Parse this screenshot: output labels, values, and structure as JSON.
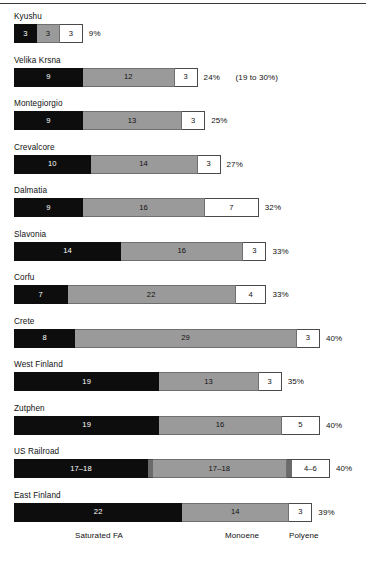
{
  "chart_data": {
    "type": "bar",
    "subtype": "stacked-horizontal",
    "title": "",
    "xlabel": "",
    "ylabel": "",
    "grid": false,
    "legend_position": "bottom",
    "series": [
      {
        "name": "Saturated FA",
        "color": "#0d0d0d"
      },
      {
        "name": "Monoene",
        "color": "#9a9a9a"
      },
      {
        "name": "Polyene",
        "color": "#ffffff"
      }
    ],
    "categories": [
      "Kyushu",
      "Velika Krsna",
      "Montegiorgio",
      "Crevalcore",
      "Dalmatia",
      "Slavonia",
      "Corfu",
      "Crete",
      "West Finland",
      "Zutphen",
      "US Railroad",
      "East Finland"
    ],
    "rows": [
      {
        "label": "Kyushu",
        "segments": [
          {
            "series": "Saturated FA",
            "label": "3",
            "value": 3
          },
          {
            "series": "Monoene",
            "label": "3",
            "value": 3
          },
          {
            "series": "Polyene",
            "label": "3",
            "value": 3
          }
        ],
        "total_label": "9%",
        "total": 9,
        "note": ""
      },
      {
        "label": "Velika Krsna",
        "segments": [
          {
            "series": "Saturated FA",
            "label": "9",
            "value": 9
          },
          {
            "series": "Monoene",
            "label": "12",
            "value": 12
          },
          {
            "series": "Polyene",
            "label": "3",
            "value": 3
          }
        ],
        "total_label": "24%",
        "total": 24,
        "note": "(19 to 30%)"
      },
      {
        "label": "Montegiorgio",
        "segments": [
          {
            "series": "Saturated FA",
            "label": "9",
            "value": 9
          },
          {
            "series": "Monoene",
            "label": "13",
            "value": 13
          },
          {
            "series": "Polyene",
            "label": "3",
            "value": 3
          }
        ],
        "total_label": "25%",
        "total": 25,
        "note": ""
      },
      {
        "label": "Crevalcore",
        "segments": [
          {
            "series": "Saturated FA",
            "label": "10",
            "value": 10
          },
          {
            "series": "Monoene",
            "label": "14",
            "value": 14
          },
          {
            "series": "Polyene",
            "label": "3",
            "value": 3
          }
        ],
        "total_label": "27%",
        "total": 27,
        "note": ""
      },
      {
        "label": "Dalmatia",
        "segments": [
          {
            "series": "Saturated FA",
            "label": "9",
            "value": 9
          },
          {
            "series": "Monoene",
            "label": "16",
            "value": 16
          },
          {
            "series": "Polyene",
            "label": "7",
            "value": 7
          }
        ],
        "total_label": "32%",
        "total": 32,
        "note": ""
      },
      {
        "label": "Slavonia",
        "segments": [
          {
            "series": "Saturated FA",
            "label": "14",
            "value": 14
          },
          {
            "series": "Monoene",
            "label": "16",
            "value": 16
          },
          {
            "series": "Polyene",
            "label": "3",
            "value": 3
          }
        ],
        "total_label": "33%",
        "total": 33,
        "note": ""
      },
      {
        "label": "Corfu",
        "segments": [
          {
            "series": "Saturated FA",
            "label": "7",
            "value": 7
          },
          {
            "series": "Monoene",
            "label": "22",
            "value": 22
          },
          {
            "series": "Polyene",
            "label": "4",
            "value": 4
          }
        ],
        "total_label": "33%",
        "total": 33,
        "note": ""
      },
      {
        "label": "Crete",
        "segments": [
          {
            "series": "Saturated FA",
            "label": "8",
            "value": 8
          },
          {
            "series": "Monoene",
            "label": "29",
            "value": 29
          },
          {
            "series": "Polyene",
            "label": "3",
            "value": 3
          }
        ],
        "total_label": "40%",
        "total": 40,
        "note": ""
      },
      {
        "label": "West Finland",
        "segments": [
          {
            "series": "Saturated FA",
            "label": "19",
            "value": 19
          },
          {
            "series": "Monoene",
            "label": "13",
            "value": 13
          },
          {
            "series": "Polyene",
            "label": "3",
            "value": 3
          }
        ],
        "total_label": "35%",
        "total": 35,
        "note": ""
      },
      {
        "label": "Zutphen",
        "segments": [
          {
            "series": "Saturated FA",
            "label": "19",
            "value": 19
          },
          {
            "series": "Monoene",
            "label": "16",
            "value": 16
          },
          {
            "series": "Polyene",
            "label": "5",
            "value": 5
          }
        ],
        "total_label": "40%",
        "total": 40,
        "note": ""
      },
      {
        "label": "US Railroad",
        "segments": [
          {
            "series": "Saturated FA",
            "label": "17–18",
            "value": 17.5
          },
          {
            "series": "divider",
            "label": "",
            "value": 1
          },
          {
            "series": "Monoene",
            "label": "17–18",
            "value": 17.5
          },
          {
            "series": "divider",
            "label": "",
            "value": 1
          },
          {
            "series": "Polyene",
            "label": "4–6",
            "value": 5
          }
        ],
        "total_label": "40%",
        "total": 40,
        "note": ""
      },
      {
        "label": "East Finland",
        "segments": [
          {
            "series": "Saturated FA",
            "label": "22",
            "value": 22
          },
          {
            "series": "Monoene",
            "label": "14",
            "value": 14
          },
          {
            "series": "Polyene",
            "label": "3",
            "value": 3
          }
        ],
        "total_label": "39%",
        "total": 39,
        "note": ""
      }
    ],
    "legend": [
      {
        "label": "Saturated FA"
      },
      {
        "label": "Monoene"
      },
      {
        "label": "Polyene"
      }
    ]
  },
  "layout": {
    "bar_left_px": 14,
    "px_per_unit": 7.65,
    "row_height_px": 43.5,
    "bar_height_px": 19
  }
}
